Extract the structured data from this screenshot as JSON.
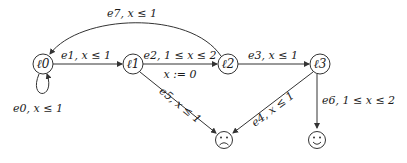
{
  "diagram": {
    "type": "timed-automaton",
    "locations": [
      {
        "id": "l0",
        "label": "ℓ0",
        "x": 43,
        "y": 64
      },
      {
        "id": "l1",
        "label": "ℓ1",
        "x": 133,
        "y": 64
      },
      {
        "id": "l2",
        "label": "ℓ2",
        "x": 228,
        "y": 64
      },
      {
        "id": "l3",
        "label": "ℓ3",
        "x": 320,
        "y": 64
      }
    ],
    "sinks": [
      {
        "id": "bad",
        "label": "☹",
        "meaning": "sad-face",
        "x": 224,
        "y": 140
      },
      {
        "id": "good",
        "label": "☺",
        "meaning": "happy-face",
        "x": 313,
        "y": 140
      }
    ],
    "edges": [
      {
        "id": "e0",
        "from": "l0",
        "to": "l0",
        "label": "e0, x ≤ 1"
      },
      {
        "id": "e1",
        "from": "l0",
        "to": "l1",
        "label": "e1, x ≤ 1"
      },
      {
        "id": "e2",
        "from": "l1",
        "to": "l2",
        "label": "e2, 1 ≤ x ≤ 2",
        "reset": "x := 0"
      },
      {
        "id": "e3",
        "from": "l2",
        "to": "l3",
        "label": "e3, x ≤ 1"
      },
      {
        "id": "e4",
        "from": "l3",
        "to": "bad",
        "label": "e4, x ≤ 1"
      },
      {
        "id": "e5",
        "from": "l1",
        "to": "bad",
        "label": "e5, x ≤ 1"
      },
      {
        "id": "e6",
        "from": "l3",
        "to": "good",
        "label": "e6, 1 ≤ x ≤ 2"
      },
      {
        "id": "e7",
        "from": "l2",
        "to": "l0",
        "label": "e7, x ≤ 1"
      }
    ]
  }
}
